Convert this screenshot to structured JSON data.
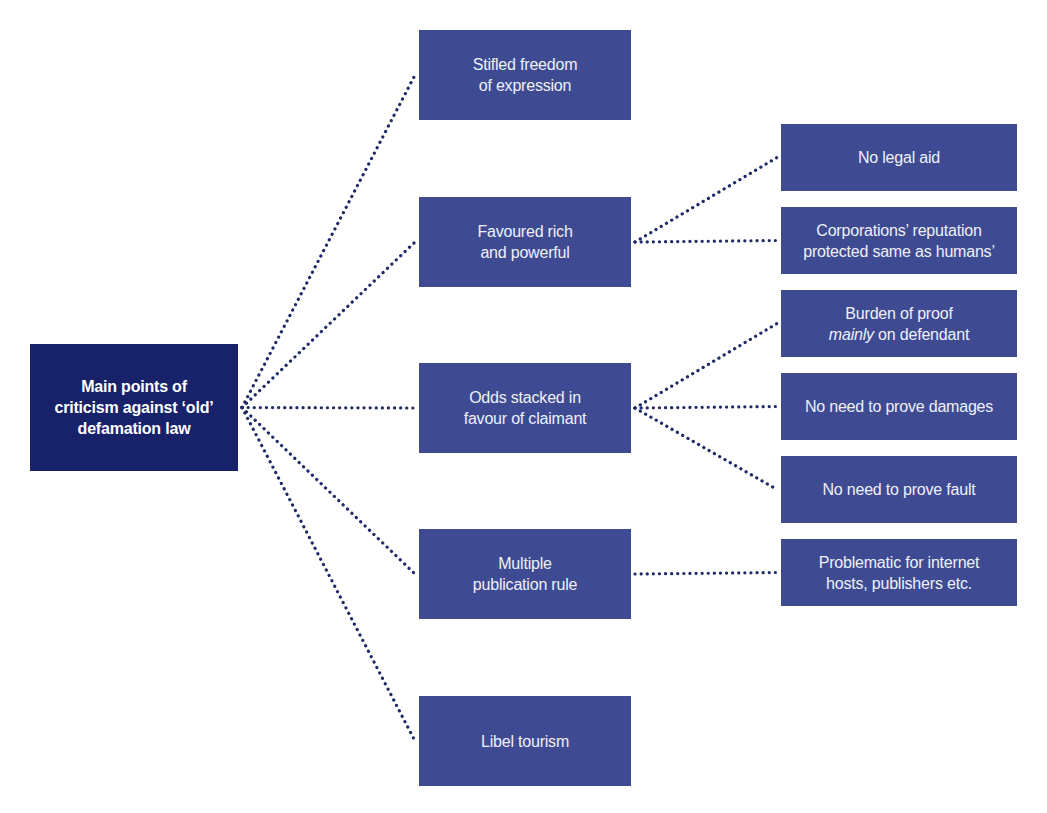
{
  "diagram": {
    "title": "Main points of criticism against ‘old’ defamation law",
    "colors": {
      "root_fill": "#18226a",
      "node_fill": "#3e4b93",
      "connector": "#1f2a66",
      "text": "#eef0f8",
      "background": "#ffffff"
    },
    "root": {
      "id": "root",
      "lines": [
        "Main points of",
        "criticism against ‘old’",
        "defamation law"
      ],
      "box": {
        "x": 30,
        "y": 344,
        "w": 208,
        "h": 127
      }
    },
    "level1": [
      {
        "id": "stifled",
        "lines": [
          "Stifled freedom",
          "of expression"
        ],
        "box": {
          "x": 419,
          "y": 30,
          "w": 212,
          "h": 90
        }
      },
      {
        "id": "favoured",
        "lines": [
          "Favoured rich",
          "and powerful"
        ],
        "box": {
          "x": 419,
          "y": 197,
          "w": 212,
          "h": 90
        }
      },
      {
        "id": "odds",
        "lines": [
          "Odds stacked in",
          "favour of claimant"
        ],
        "box": {
          "x": 419,
          "y": 363,
          "w": 212,
          "h": 90
        }
      },
      {
        "id": "multiple",
        "lines": [
          "Multiple",
          "publication rule"
        ],
        "box": {
          "x": 419,
          "y": 529,
          "w": 212,
          "h": 90
        }
      },
      {
        "id": "libel",
        "lines": [
          "Libel tourism"
        ],
        "box": {
          "x": 419,
          "y": 696,
          "w": 212,
          "h": 90
        }
      }
    ],
    "level2": [
      {
        "id": "legal_aid",
        "parent": "favoured",
        "lines": [
          "No legal aid"
        ],
        "box": {
          "x": 781,
          "y": 124,
          "w": 236,
          "h": 67
        }
      },
      {
        "id": "corporations",
        "parent": "favoured",
        "lines": [
          "Corporations’ reputation",
          "protected same as humans’"
        ],
        "box": {
          "x": 781,
          "y": 207,
          "w": 236,
          "h": 67
        }
      },
      {
        "id": "burden",
        "parent": "odds",
        "lines": [
          "Burden of proof",
          "mainly on defendant"
        ],
        "italic_word": "mainly",
        "box": {
          "x": 781,
          "y": 290,
          "w": 236,
          "h": 67
        }
      },
      {
        "id": "damages",
        "parent": "odds",
        "lines": [
          "No need to prove damages"
        ],
        "box": {
          "x": 781,
          "y": 373,
          "w": 236,
          "h": 67
        }
      },
      {
        "id": "fault",
        "parent": "odds",
        "lines": [
          "No need to prove fault"
        ],
        "box": {
          "x": 781,
          "y": 456,
          "w": 236,
          "h": 67
        }
      },
      {
        "id": "problematic",
        "parent": "multiple",
        "lines": [
          "Problematic for internet",
          "hosts, publishers etc."
        ],
        "box": {
          "x": 781,
          "y": 539,
          "w": 236,
          "h": 67
        }
      }
    ],
    "edges": [
      {
        "from": "root",
        "to": "stifled"
      },
      {
        "from": "root",
        "to": "favoured"
      },
      {
        "from": "root",
        "to": "odds"
      },
      {
        "from": "root",
        "to": "multiple"
      },
      {
        "from": "root",
        "to": "libel"
      },
      {
        "from": "favoured",
        "to": "legal_aid"
      },
      {
        "from": "favoured",
        "to": "corporations"
      },
      {
        "from": "odds",
        "to": "burden"
      },
      {
        "from": "odds",
        "to": "damages"
      },
      {
        "from": "odds",
        "to": "fault"
      },
      {
        "from": "multiple",
        "to": "problematic"
      }
    ]
  }
}
